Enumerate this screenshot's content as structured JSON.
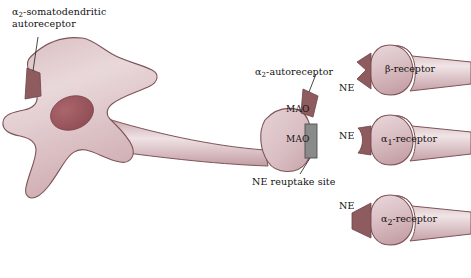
{
  "figure": {
    "background_color": "#ffffff"
  },
  "colors": {
    "cell_fill_light": "#e7d4d6",
    "cell_fill_mid": "#d3b4b8",
    "cell_edge": "#7d5458",
    "nucleus": "#9e5a60",
    "receptor_dark": "#8e5b5e",
    "reuptake_gray": "#8a8a8a",
    "reuptake_gray_edge": "#4f4f4f",
    "text": "#111111",
    "leader_line": "#333333"
  },
  "neuron": {
    "soma_label": "cell-body",
    "axon_label": "axon",
    "terminal_label": "axon-terminal",
    "nucleus_label": "nucleus"
  },
  "labels": {
    "somatodendritic": {
      "line1_prefix": "α",
      "line1_sub": "2",
      "line1_rest": "-somatodendritic",
      "line2": "autoreceptor",
      "full": "α2-somatodendritic autoreceptor"
    },
    "autoreceptor": {
      "prefix": "α",
      "sub": "2",
      "rest": "-autoreceptor",
      "full": "α2-autoreceptor"
    },
    "reuptake_site": "NE reuptake site",
    "mao_upper": "MAO",
    "mao_lower": "MAO"
  },
  "targets": [
    {
      "id": "beta",
      "ne_label": "NE",
      "prefix": "β",
      "sub": "",
      "rest": "-receptor",
      "full": "β-receptor",
      "receptor_shape": "zigzag-notch"
    },
    {
      "id": "alpha1",
      "ne_label": "NE",
      "prefix": "α",
      "sub": "1",
      "rest": "-receptor",
      "full": "α1-receptor",
      "receptor_shape": "concave-bowtie"
    },
    {
      "id": "alpha2",
      "ne_label": "NE",
      "prefix": "α",
      "sub": "2",
      "rest": "-receptor",
      "full": "α2-receptor",
      "receptor_shape": "triangle"
    }
  ]
}
